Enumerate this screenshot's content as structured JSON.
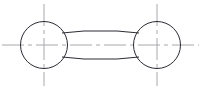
{
  "drawing": {
    "title": "Two-boss connecting link plan view",
    "view_type": "plan view",
    "background_color": "#ffffff",
    "outline_color": "#2b2b33",
    "centerline_color": "#a8a8ad",
    "canvas": {
      "width": 201,
      "height": 89
    },
    "entities": {
      "left_circle": {
        "name": "left boss circle",
        "cx": 44,
        "cy": 45,
        "r": 23.5
      },
      "right_circle": {
        "name": "right boss circle",
        "cx": 157,
        "cy": 45,
        "r": 23.5
      },
      "connecting_bar": {
        "name": "connecting bar",
        "top_edge": "M 62 33 L 84 31 L 117 31 L 139 33",
        "bottom_edge": "M 62 57 L 84 59 L 117 59 L 139 57",
        "left_x": 62,
        "right_x": 139,
        "top_y_mid": 31,
        "bottom_y_mid": 59,
        "top_y_end": 33,
        "bottom_y_end": 57
      },
      "horizontal_centerline": {
        "name": "horizontal centerline",
        "y": 45,
        "x_start": 2,
        "x_end": 199,
        "dash_pattern": "22 4 4 4"
      },
      "left_vertical_centerline": {
        "name": "left vertical centerline",
        "x": 44,
        "y_start": 4,
        "y_end": 86,
        "dash_pattern": "22 4 4 4"
      },
      "right_vertical_centerline": {
        "name": "right vertical centerline",
        "x": 157,
        "y_start": 4,
        "y_end": 86,
        "dash_pattern": "22 4 4 4"
      }
    }
  }
}
